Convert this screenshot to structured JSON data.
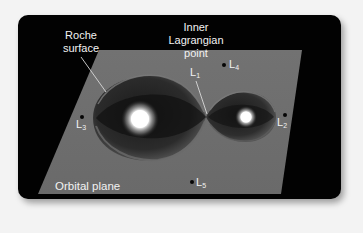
{
  "figure": {
    "labels": {
      "roche_surface": [
        "Roche",
        "surface"
      ],
      "inner_lagrangian": [
        "Inner",
        "Lagrangian",
        "point"
      ],
      "orbital_plane": "Orbital plane"
    },
    "points": [
      {
        "id": "L1",
        "base": "L",
        "sub": "1"
      },
      {
        "id": "L2",
        "base": "L",
        "sub": "2"
      },
      {
        "id": "L3",
        "base": "L",
        "sub": "3"
      },
      {
        "id": "L4",
        "base": "L",
        "sub": "4"
      },
      {
        "id": "L5",
        "base": "L",
        "sub": "5"
      }
    ],
    "colors": {
      "background": "#020202",
      "plane": "#6e6e6e",
      "text": "#f2f2f2",
      "star_glow": "#ffffff"
    }
  }
}
